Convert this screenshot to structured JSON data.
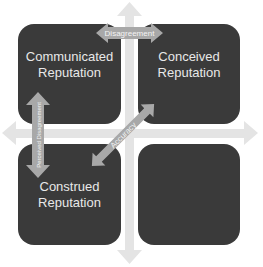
{
  "diagram": {
    "quadrants": [
      {
        "id": "top-left",
        "line1": "Communicated",
        "line2": "Reputation"
      },
      {
        "id": "top-right",
        "line1": "Conceived",
        "line2": "Reputation"
      },
      {
        "id": "bottom-left",
        "line1": "Construed",
        "line2": "Reputation"
      },
      {
        "id": "bottom-right",
        "line1": "",
        "line2": ""
      }
    ],
    "arrows": {
      "horizontal_top": "Disagreement",
      "vertical_left": "Perceived Disagreement",
      "diagonal": "Accuracy"
    },
    "colors": {
      "box": "#3a3a3a",
      "axis": "#e4e4e4",
      "arrow": "#a8a8a8",
      "text": "#e8e8e8"
    }
  }
}
